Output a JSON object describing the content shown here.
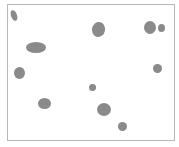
{
  "canvas": {
    "border_color": "#b8b8b8",
    "background": "#ffffff",
    "blob_color": "#8a8a8a",
    "blobs": [
      {
        "cx": 14,
        "cy": 15,
        "w": 6,
        "h": 11,
        "rot": -20
      },
      {
        "cx": 36,
        "cy": 47,
        "w": 20,
        "h": 11,
        "rot": 0
      },
      {
        "cx": 19,
        "cy": 73,
        "w": 11,
        "h": 12,
        "rot": 0
      },
      {
        "cx": 98,
        "cy": 29,
        "w": 13,
        "h": 15,
        "rot": 10
      },
      {
        "cx": 150,
        "cy": 27,
        "w": 12,
        "h": 13,
        "rot": 0
      },
      {
        "cx": 161,
        "cy": 28,
        "w": 7,
        "h": 8,
        "rot": 0
      },
      {
        "cx": 157,
        "cy": 68,
        "w": 9,
        "h": 9,
        "rot": 0
      },
      {
        "cx": 92,
        "cy": 87,
        "w": 7,
        "h": 7,
        "rot": 0
      },
      {
        "cx": 44,
        "cy": 103,
        "w": 13,
        "h": 11,
        "rot": 0
      },
      {
        "cx": 104,
        "cy": 109,
        "w": 14,
        "h": 13,
        "rot": 0
      },
      {
        "cx": 122,
        "cy": 126,
        "w": 9,
        "h": 9,
        "rot": 0
      }
    ]
  }
}
